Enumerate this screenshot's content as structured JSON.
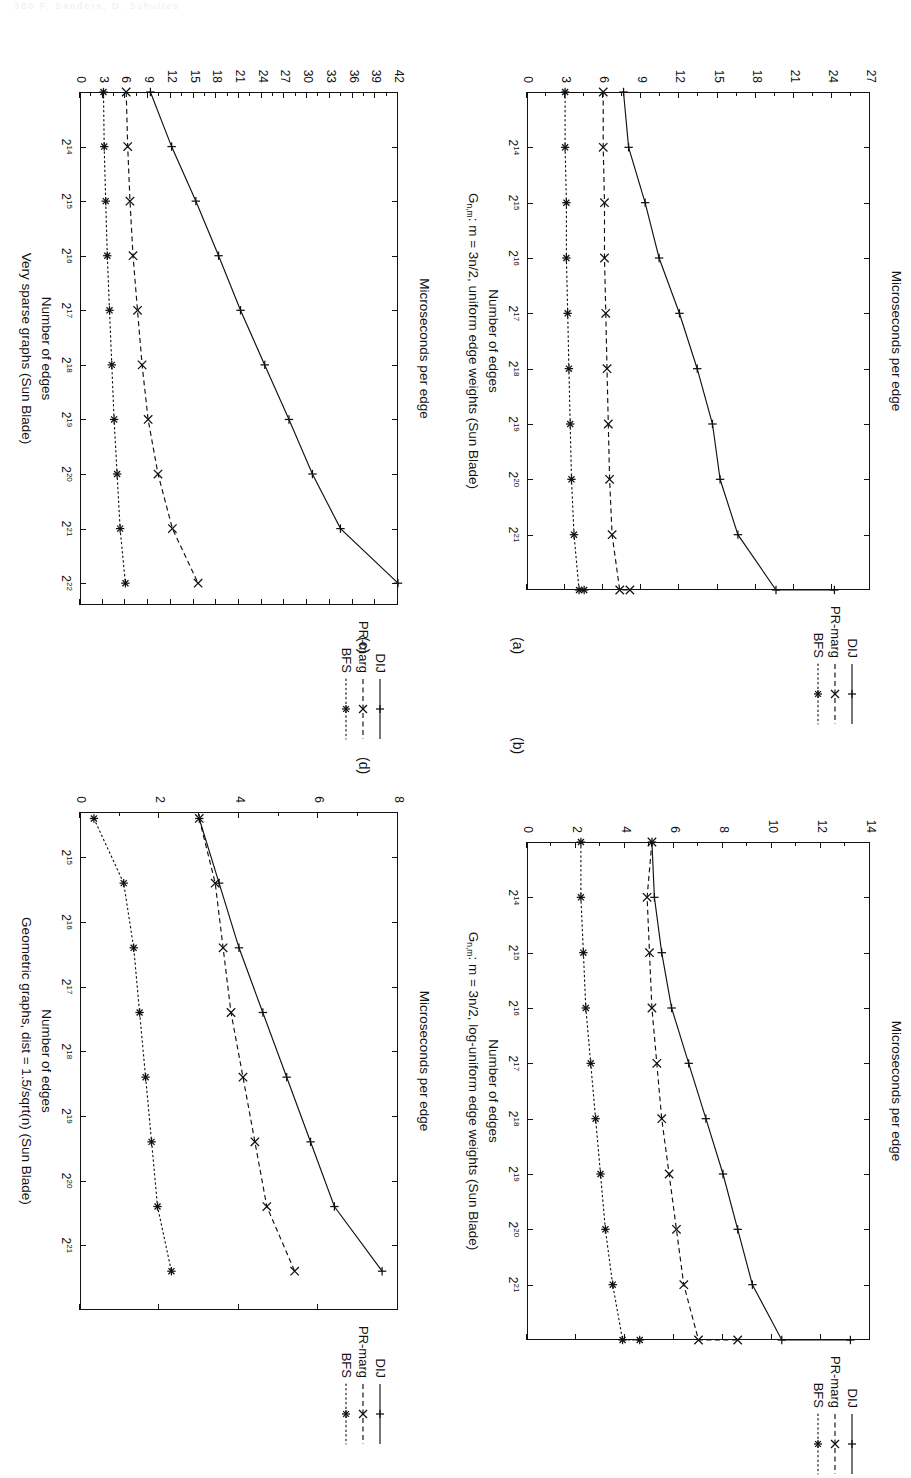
{
  "page": {
    "header_faint": "380      P. Sanders, D. Schultes",
    "width": 911,
    "height": 1393,
    "rotation_note": "figure page rotated 90 degrees clockwise"
  },
  "labels": {
    "y_axis_title": "Microseconds per edge",
    "x_axis_title": "Number of edges",
    "legend": [
      "DIJ",
      "PR-marg",
      "BFS"
    ]
  },
  "subcaptions": {
    "a": "(a)",
    "b": "(b)",
    "c": "(c)",
    "d": "(d)"
  },
  "chart_data": [
    {
      "id": "a",
      "type": "line",
      "title": "G_{n,m}: m = 3n/2, uniform edge weights (Sun Blade)",
      "title_parts": {
        "pre": "G",
        "sub": "n,m",
        "post": ": m = 3n/2, uniform edge weights (Sun Blade)"
      },
      "xlabel": "Number of edges",
      "ylabel": "Microseconds per edge",
      "x_ticklabels": [
        "2^14",
        "2^15",
        "2^16",
        "2^17",
        "2^18",
        "2^19",
        "2^20",
        "2^21"
      ],
      "x": [
        13,
        14,
        15,
        16,
        17,
        18,
        19,
        20,
        21,
        22
      ],
      "xlim": [
        13,
        22
      ],
      "ylim": [
        0,
        27
      ],
      "y_ticklabels": [
        "0",
        "3",
        "6",
        "9",
        "12",
        "15",
        "18",
        "21",
        "24",
        "27"
      ],
      "grid": false,
      "legend_position": "top-right",
      "series": [
        {
          "name": "DIJ",
          "marker": "plus",
          "linestyle": "solid",
          "values": [
            7.6,
            8.0,
            9.3,
            10.4,
            12.0,
            13.4,
            14.6,
            15.2,
            16.6,
            19.6,
            24.2
          ]
        },
        {
          "name": "PR-marg",
          "marker": "x",
          "linestyle": "dashed",
          "values": [
            6.0,
            6.0,
            6.1,
            6.1,
            6.2,
            6.3,
            6.4,
            6.5,
            6.7,
            7.3,
            8.1
          ]
        },
        {
          "name": "BFS",
          "marker": "star",
          "linestyle": "dotted",
          "values": [
            3.0,
            3.0,
            3.1,
            3.1,
            3.2,
            3.3,
            3.4,
            3.5,
            3.7,
            4.1,
            4.5
          ]
        }
      ]
    },
    {
      "id": "b",
      "type": "line",
      "title": "G_{n,m}: m = 3n/2, log-uniform edge weights (Sun Blade)",
      "title_parts": {
        "pre": "G",
        "sub": "n,m",
        "post": ": m = 3n/2, log-uniform edge weights (Sun Blade)"
      },
      "xlabel": "Number of edges",
      "ylabel": "Microseconds per edge",
      "x_ticklabels": [
        "2^14",
        "2^15",
        "2^16",
        "2^17",
        "2^18",
        "2^19",
        "2^20",
        "2^21"
      ],
      "x": [
        13,
        14,
        15,
        16,
        17,
        18,
        19,
        20,
        21,
        22
      ],
      "xlim": [
        13,
        22
      ],
      "ylim": [
        0,
        14
      ],
      "y_ticklabels": [
        "0",
        "2",
        "4",
        "6",
        "8",
        "10",
        "12",
        "14"
      ],
      "grid": false,
      "legend_position": "top-right",
      "series": [
        {
          "name": "DIJ",
          "marker": "plus",
          "linestyle": "solid",
          "values": [
            5.1,
            5.2,
            5.5,
            5.9,
            6.6,
            7.3,
            8.0,
            8.6,
            9.2,
            10.4,
            13.2
          ]
        },
        {
          "name": "PR-marg",
          "marker": "x",
          "linestyle": "dashed",
          "values": [
            5.1,
            4.9,
            5.0,
            5.1,
            5.3,
            5.5,
            5.8,
            6.1,
            6.4,
            7.0,
            8.6
          ]
        },
        {
          "name": "BFS",
          "marker": "star",
          "linestyle": "dotted",
          "values": [
            2.2,
            2.2,
            2.3,
            2.4,
            2.6,
            2.8,
            3.0,
            3.2,
            3.5,
            3.9,
            4.6
          ]
        }
      ]
    },
    {
      "id": "c",
      "type": "line",
      "title": "Very sparse graphs (Sun Blade)",
      "xlabel": "Number of edges",
      "ylabel": "Microseconds per edge",
      "x_ticklabels": [
        "2^14",
        "2^15",
        "2^16",
        "2^17",
        "2^18",
        "2^19",
        "2^20",
        "2^21",
        "2^22"
      ],
      "x": [
        13,
        14,
        15,
        16,
        17,
        18,
        19,
        20,
        21,
        22
      ],
      "xlim": [
        13,
        22.4
      ],
      "ylim": [
        0,
        42
      ],
      "y_ticklabels": [
        "0",
        "3",
        "6",
        "9",
        "12",
        "15",
        "18",
        "21",
        "24",
        "27",
        "30",
        "33",
        "36",
        "39",
        "42"
      ],
      "grid": false,
      "legend_position": "top-right",
      "series": [
        {
          "name": "DIJ",
          "marker": "plus",
          "linestyle": "solid",
          "values": [
            9.3,
            12.1,
            15.3,
            18.3,
            21.2,
            24.4,
            27.6,
            30.7,
            34.4,
            42.0
          ]
        },
        {
          "name": "PR-marg",
          "marker": "x",
          "linestyle": "dashed",
          "values": [
            6.1,
            6.3,
            6.6,
            7.0,
            7.6,
            8.2,
            9.0,
            10.3,
            12.2,
            15.6
          ]
        },
        {
          "name": "BFS",
          "marker": "star",
          "linestyle": "dotted",
          "values": [
            3.1,
            3.2,
            3.4,
            3.6,
            3.9,
            4.2,
            4.5,
            4.9,
            5.3,
            6.0
          ]
        }
      ]
    },
    {
      "id": "d",
      "type": "line",
      "title": "Geometric graphs, dist = 1.5/sqrt(n) (Sun Blade)",
      "xlabel": "Number of edges",
      "ylabel": "Microseconds per edge",
      "x_ticklabels": [
        "2^15",
        "2^16",
        "2^17",
        "2^18",
        "2^19",
        "2^20",
        "2^21"
      ],
      "x": [
        14.4,
        15.4,
        16.4,
        17.4,
        18.4,
        19.4,
        20.4,
        21.4
      ],
      "xlim": [
        14.3,
        22.0
      ],
      "ylim": [
        0,
        8
      ],
      "y_ticklabels": [
        "0",
        "2",
        "4",
        "6",
        "8"
      ],
      "grid": false,
      "legend_position": "top-right",
      "series": [
        {
          "name": "DIJ",
          "marker": "plus",
          "linestyle": "solid",
          "values": [
            3.0,
            3.5,
            4.0,
            4.6,
            5.2,
            5.8,
            6.4,
            7.6
          ]
        },
        {
          "name": "PR-marg",
          "marker": "x",
          "linestyle": "dashed",
          "values": [
            3.0,
            3.4,
            3.6,
            3.8,
            4.1,
            4.4,
            4.7,
            5.4
          ]
        },
        {
          "name": "BFS",
          "marker": "star",
          "linestyle": "dotted",
          "values": [
            0.35,
            1.1,
            1.35,
            1.5,
            1.65,
            1.8,
            1.95,
            2.3
          ]
        }
      ]
    }
  ]
}
